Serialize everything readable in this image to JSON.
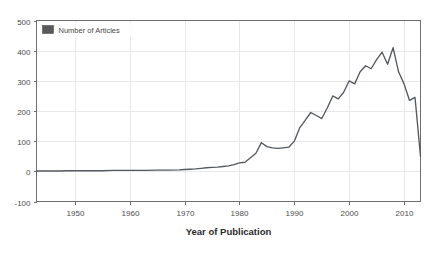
{
  "chart_data": {
    "type": "line",
    "title": "",
    "subtitle": "",
    "xlabel": "Year of Publication",
    "ylabel": "",
    "xlim": [
      1943,
      2013
    ],
    "ylim": [
      -100,
      500
    ],
    "grid": true,
    "legend_position": "top-left",
    "legend": [
      "Number of Articles"
    ],
    "xticks": [
      1950,
      1960,
      1970,
      1980,
      1990,
      2000,
      2010
    ],
    "xtick_labels": [
      "1950",
      "1960",
      "1970",
      "1980",
      "1990",
      "2000",
      "2010"
    ],
    "yticks": [
      -100,
      0,
      100,
      200,
      300,
      400,
      500
    ],
    "ytick_labels": [
      "-100",
      "0",
      "100",
      "200",
      "300",
      "400",
      "500"
    ],
    "series": [
      {
        "name": "Number of Articles",
        "color": "#555a5e",
        "x": [
          1943,
          1945,
          1947,
          1949,
          1951,
          1953,
          1955,
          1957,
          1959,
          1961,
          1963,
          1965,
          1967,
          1969,
          1970,
          1971,
          1972,
          1973,
          1974,
          1975,
          1976,
          1977,
          1978,
          1979,
          1980,
          1981,
          1982,
          1983,
          1984,
          1985,
          1986,
          1987,
          1988,
          1989,
          1990,
          1991,
          1992,
          1993,
          1994,
          1995,
          1996,
          1997,
          1998,
          1999,
          2000,
          2001,
          2002,
          2003,
          2004,
          2005,
          2006,
          2007,
          2008,
          2009,
          2010,
          2011,
          2012,
          2013
        ],
        "values": [
          1,
          1,
          1,
          2,
          2,
          2,
          2,
          3,
          3,
          3,
          3,
          4,
          4,
          5,
          6,
          7,
          8,
          10,
          12,
          13,
          14,
          16,
          18,
          22,
          28,
          30,
          45,
          60,
          95,
          82,
          78,
          76,
          78,
          80,
          100,
          145,
          170,
          195,
          185,
          175,
          210,
          250,
          240,
          262,
          300,
          290,
          330,
          350,
          340,
          370,
          395,
          355,
          410,
          330,
          290,
          235,
          245,
          50
        ]
      }
    ]
  },
  "axis": {
    "x_title": "Year of Publication"
  },
  "legend_entry": {
    "label": "Number of Articles",
    "swatch_color": "#595959"
  },
  "colors": {
    "line": "#555a5e",
    "grid": "#e8e8ec",
    "frame": "#6f6f6f",
    "background": "#ffffff",
    "tick_text": "#4d4d4d",
    "axis_title": "#2b2b2b"
  }
}
